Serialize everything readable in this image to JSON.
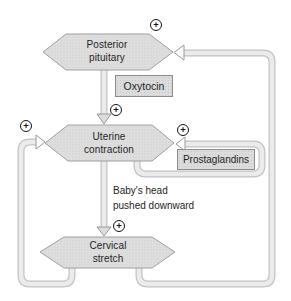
{
  "diagram": {
    "type": "feedback-loop-flowchart",
    "symbols": {
      "plus": "+"
    },
    "colors": {
      "background": "#ffffff",
      "node_fill": "#dedede",
      "node_border": "#a0a0a0",
      "box_fill": "#dcdcdc",
      "box_border": "#8c8c8c",
      "pipe_fill": "#ebebeb",
      "pipe_border": "#c2c2c2",
      "arrow_fill": "#ffffff",
      "text": "#242424"
    },
    "nodes": [
      {
        "id": "posterior-pituitary",
        "line1": "Posterior",
        "line2": "pituitary"
      },
      {
        "id": "uterine-contraction",
        "line1": "Uterine",
        "line2": "contraction"
      },
      {
        "id": "cervical-stretch",
        "line1": "Cervical",
        "line2": "stretch"
      }
    ],
    "boxes": [
      {
        "id": "oxytocin",
        "label": "Oxytocin"
      },
      {
        "id": "prostaglandins",
        "label": "Prostaglandins"
      }
    ],
    "annotation": {
      "line1": "Baby's head",
      "line2": "pushed downward"
    }
  }
}
